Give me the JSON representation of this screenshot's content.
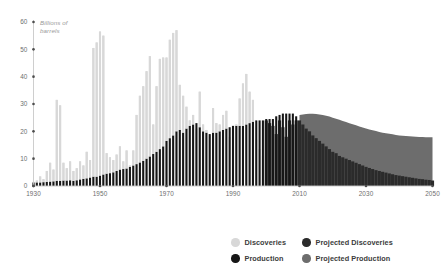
{
  "chart_data": {
    "type": "bar",
    "title": "",
    "xlabel": "",
    "ylabel": "Billions of\nbarrels",
    "ylim": [
      0,
      60
    ],
    "xlim": [
      1930,
      2050
    ],
    "grid": false,
    "legend_position": "top-right",
    "yticks": [
      0,
      10,
      20,
      30,
      40,
      50,
      60
    ],
    "xticks": [
      1930,
      1950,
      1970,
      1990,
      2010,
      2030,
      2050
    ],
    "colors": {
      "discoveries": "#d8d8d8",
      "production": "#161616",
      "projected_discoveries": "#2b2b2b",
      "projected_production": "#6d6d6d",
      "axis": "#c8c8c8",
      "tick_text": "#6e6e6e",
      "axis_label_text": "#9a9a9a",
      "legend_text": "#3c3c3c"
    },
    "legend": [
      {
        "label": "Discoveries",
        "color": "#d8d8d8"
      },
      {
        "label": "Production",
        "color": "#161616"
      },
      {
        "label": "Projected Discoveries",
        "color": "#2b2b2b"
      },
      {
        "label": "Projected Production",
        "color": "#6d6d6d"
      }
    ],
    "x": [
      1930,
      1931,
      1932,
      1933,
      1934,
      1935,
      1936,
      1937,
      1938,
      1939,
      1940,
      1941,
      1942,
      1943,
      1944,
      1945,
      1946,
      1947,
      1948,
      1949,
      1950,
      1951,
      1952,
      1953,
      1954,
      1955,
      1956,
      1957,
      1958,
      1959,
      1960,
      1961,
      1962,
      1963,
      1964,
      1965,
      1966,
      1967,
      1968,
      1969,
      1970,
      1971,
      1972,
      1973,
      1974,
      1975,
      1976,
      1977,
      1978,
      1979,
      1980,
      1981,
      1982,
      1983,
      1984,
      1985,
      1986,
      1987,
      1988,
      1989,
      1990,
      1991,
      1992,
      1993,
      1994,
      1995,
      1996,
      1997,
      1998,
      1999,
      2000,
      2001,
      2002,
      2003,
      2004,
      2005,
      2006,
      2007,
      2008,
      2009,
      2010,
      2011,
      2012,
      2013,
      2014,
      2015,
      2016,
      2017,
      2018,
      2019,
      2020,
      2021,
      2022,
      2023,
      2024,
      2025,
      2026,
      2027,
      2028,
      2029,
      2030,
      2031,
      2032,
      2033,
      2034,
      2035,
      2036,
      2037,
      2038,
      2039,
      2040,
      2041,
      2042,
      2043,
      2044,
      2045,
      2046,
      2047,
      2048,
      2049,
      2050
    ],
    "series": [
      {
        "name": "Discoveries",
        "type": "bar",
        "color": "#d8d8d8",
        "values": [
          1.5,
          2.0,
          3.5,
          2.5,
          5.5,
          8.5,
          6.0,
          31.5,
          29.5,
          8.5,
          6.5,
          9.0,
          5.5,
          6.5,
          9.0,
          7.5,
          12.5,
          9.5,
          50.5,
          52.5,
          56.5,
          55.0,
          12.0,
          10.5,
          9.5,
          11.5,
          14.5,
          9.0,
          13.0,
          7.5,
          13.0,
          26.0,
          33.0,
          36.5,
          42.0,
          47.5,
          22.5,
          36.5,
          46.5,
          47.0,
          47.0,
          53.5,
          56.0,
          57.0,
          37.0,
          33.0,
          29.0,
          24.0,
          26.0,
          21.0,
          34.5,
          22.5,
          20.5,
          18.5,
          28.5,
          23.0,
          22.5,
          26.0,
          27.5,
          18.0,
          14.5,
          22.5,
          32.0,
          37.5,
          41.0,
          34.5,
          31.5,
          17.0,
          13.5,
          11.0,
          null,
          null,
          null,
          null,
          null,
          null,
          null,
          null,
          null,
          null,
          null,
          null,
          null,
          null,
          null,
          null,
          null,
          null,
          null,
          null,
          null,
          null,
          null,
          null,
          null,
          null,
          null,
          null,
          null,
          null,
          null,
          null,
          null,
          null,
          null,
          null,
          null,
          null,
          null,
          null,
          null,
          null,
          null,
          null,
          null,
          null,
          null,
          null,
          null,
          null,
          null
        ]
      },
      {
        "name": "Projected Discoveries",
        "type": "bar",
        "color": "#2b2b2b",
        "values": [
          null,
          null,
          null,
          null,
          null,
          null,
          null,
          null,
          null,
          null,
          null,
          null,
          null,
          null,
          null,
          null,
          null,
          null,
          null,
          null,
          null,
          null,
          null,
          null,
          null,
          null,
          null,
          null,
          null,
          null,
          null,
          null,
          null,
          null,
          null,
          null,
          null,
          null,
          null,
          null,
          null,
          null,
          null,
          null,
          null,
          null,
          null,
          null,
          null,
          null,
          null,
          null,
          null,
          null,
          null,
          null,
          null,
          null,
          null,
          null,
          null,
          null,
          null,
          null,
          null,
          null,
          null,
          null,
          null,
          null,
          24.0,
          23.0,
          22.0,
          19.0,
          24.0,
          21.5,
          18.0,
          24.0,
          22.5,
          24.0,
          24.0,
          22.5,
          21.0,
          20.0,
          18.5,
          17.5,
          16.5,
          15.5,
          14.5,
          13.5,
          12.5,
          12.0,
          11.0,
          10.5,
          10.0,
          9.5,
          9.0,
          8.5,
          8.0,
          7.5,
          7.0,
          6.6,
          6.2,
          5.8,
          5.5,
          5.2,
          4.9,
          4.6,
          4.3,
          4.0,
          3.8,
          3.6,
          3.4,
          3.2,
          3.0,
          2.8,
          2.6,
          2.5,
          2.3,
          2.2,
          2.0
        ]
      },
      {
        "name": "Production",
        "type": "bar",
        "color": "#161616",
        "values": [
          1.3,
          1.3,
          1.3,
          1.4,
          1.5,
          1.6,
          1.7,
          1.9,
          1.9,
          2.0,
          2.0,
          2.1,
          1.9,
          2.1,
          2.4,
          2.6,
          2.8,
          3.1,
          3.4,
          3.4,
          3.8,
          4.2,
          4.5,
          4.7,
          5.0,
          5.5,
          6.0,
          6.2,
          6.4,
          7.0,
          7.5,
          8.0,
          8.6,
          9.2,
          10.0,
          10.8,
          11.7,
          12.5,
          13.5,
          14.5,
          16.5,
          17.5,
          18.5,
          20.0,
          20.5,
          19.5,
          21.0,
          22.0,
          22.5,
          23.0,
          21.5,
          20.0,
          19.5,
          19.0,
          19.5,
          19.5,
          20.0,
          20.5,
          21.0,
          21.5,
          22.0,
          22.0,
          22.0,
          22.0,
          22.5,
          23.0,
          23.5,
          24.0,
          24.0,
          24.0,
          24.5,
          24.5,
          24.5,
          25.5,
          26.0,
          26.5,
          26.5,
          26.5,
          26.5,
          25.5,
          null,
          null,
          null,
          null,
          null,
          null,
          null,
          null,
          null,
          null,
          null,
          null,
          null,
          null,
          null,
          null,
          null,
          null,
          null,
          null,
          null,
          null,
          null,
          null,
          null,
          null,
          null,
          null,
          null,
          null,
          null,
          null,
          null,
          null,
          null,
          null,
          null,
          null,
          null,
          null,
          null
        ]
      },
      {
        "name": "Projected Production",
        "type": "area",
        "color": "#6d6d6d",
        "values": [
          null,
          null,
          null,
          null,
          null,
          null,
          null,
          null,
          null,
          null,
          null,
          null,
          null,
          null,
          null,
          null,
          null,
          null,
          null,
          null,
          null,
          null,
          null,
          null,
          null,
          null,
          null,
          null,
          null,
          null,
          null,
          null,
          null,
          null,
          null,
          null,
          null,
          null,
          null,
          null,
          null,
          null,
          null,
          null,
          null,
          null,
          null,
          null,
          null,
          null,
          null,
          null,
          null,
          null,
          null,
          null,
          null,
          null,
          null,
          null,
          null,
          null,
          null,
          null,
          null,
          null,
          null,
          null,
          null,
          null,
          null,
          null,
          null,
          null,
          null,
          null,
          null,
          null,
          null,
          null,
          26.0,
          26.2,
          26.3,
          26.4,
          26.4,
          26.3,
          26.2,
          26.0,
          25.7,
          25.4,
          25.0,
          24.6,
          24.2,
          23.8,
          23.4,
          23.0,
          22.6,
          22.2,
          21.8,
          21.4,
          21.0,
          20.7,
          20.4,
          20.1,
          19.8,
          19.5,
          19.3,
          19.1,
          18.9,
          18.7,
          18.5,
          18.4,
          18.3,
          18.2,
          18.1,
          18.0,
          17.9,
          17.9,
          17.8,
          17.8,
          17.8
        ]
      }
    ]
  }
}
